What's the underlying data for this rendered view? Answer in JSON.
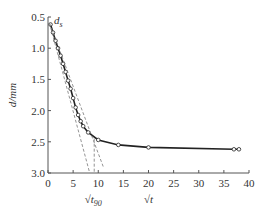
{
  "chart_data": {
    "type": "line",
    "title": "",
    "xlabel": "√t",
    "ylabel": "d/mm",
    "xlim": [
      0,
      40
    ],
    "ylim": [
      3.0,
      0.5
    ],
    "y_inverted": true,
    "grid": false,
    "x_ticks": [
      0,
      5,
      10,
      15,
      20,
      25,
      30,
      35,
      40
    ],
    "y_ticks": [
      0.5,
      1.0,
      1.5,
      2.0,
      2.5,
      3.0
    ],
    "x_tick_labels": [
      "0",
      "5",
      "10",
      "15",
      "20",
      "25",
      "30",
      "35",
      "40"
    ],
    "y_tick_labels": [
      "0.5",
      "1.0",
      "1.5",
      "2.0",
      "2.5",
      "3.0"
    ],
    "annotations": [
      {
        "text": "d",
        "sub": "s",
        "x": 1.2,
        "y": 0.55
      },
      {
        "text": "√t",
        "sub": "90",
        "x": 9.0,
        "y": 3.3
      }
    ],
    "series": [
      {
        "name": "measured",
        "style": "solid-with-circles",
        "x": [
          0.5,
          1.0,
          1.5,
          2.0,
          2.5,
          3.0,
          3.5,
          4.0,
          4.5,
          5.0,
          5.5,
          6.0,
          6.5,
          7.0,
          8.0,
          10.0,
          14.0,
          20.0,
          37.0,
          38.0
        ],
        "y": [
          0.62,
          0.75,
          0.88,
          1.0,
          1.12,
          1.25,
          1.38,
          1.52,
          1.65,
          1.8,
          1.95,
          2.07,
          2.17,
          2.25,
          2.35,
          2.47,
          2.55,
          2.59,
          2.62,
          2.62
        ]
      },
      {
        "name": "initial tangent",
        "style": "dashed",
        "x": [
          0.3,
          8.3
        ],
        "y": [
          0.6,
          3.0
        ]
      },
      {
        "name": "1.15x tangent",
        "style": "dashed",
        "x": [
          0.3,
          11.0
        ],
        "y": [
          0.6,
          2.9
        ]
      },
      {
        "name": "t90 marker",
        "style": "dashed",
        "x": [
          9.2,
          9.2
        ],
        "y": [
          2.45,
          3.0
        ]
      }
    ]
  }
}
